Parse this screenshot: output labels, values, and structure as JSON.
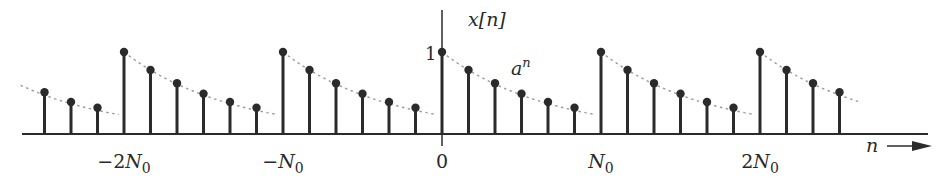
{
  "figure": {
    "y_label": "x[n]",
    "x_label": "n",
    "envelope_label": "a",
    "envelope_exponent": "n",
    "y_tick_label": "1",
    "x_tick_labels": [
      {
        "text": "−2N",
        "sub": "0",
        "n": -12
      },
      {
        "text": "−N",
        "sub": "0",
        "n": -6
      },
      {
        "text": "0",
        "sub": "",
        "n": 0
      },
      {
        "text": "N",
        "sub": "0",
        "n": 6
      },
      {
        "text": "2N",
        "sub": "0",
        "n": 12
      }
    ],
    "colors": {
      "stem": "#2b2b2b",
      "envelope": "#9a9a9a",
      "axis": "#2b2b2b"
    }
  },
  "chart_data": {
    "type": "stem",
    "title": "",
    "xlabel": "n",
    "ylabel": "x[n]",
    "period_samples": 6,
    "n": [
      -15,
      -14,
      -13,
      -12,
      -11,
      -10,
      -9,
      -8,
      -7,
      -6,
      -5,
      -4,
      -3,
      -2,
      -1,
      0,
      1,
      2,
      3,
      4,
      5,
      6,
      7,
      8,
      9,
      10,
      11,
      12,
      13,
      14,
      15
    ],
    "values": [
      0.51,
      0.39,
      0.32,
      1.0,
      0.78,
      0.62,
      0.49,
      0.39,
      0.32,
      1.0,
      0.78,
      0.62,
      0.49,
      0.39,
      0.32,
      1.0,
      0.78,
      0.62,
      0.49,
      0.39,
      0.32,
      1.0,
      0.78,
      0.62,
      0.49,
      0.39,
      0.32,
      1.0,
      0.78,
      0.62,
      0.51
    ],
    "x_ticks": [
      "-2N0",
      "-N0",
      "0",
      "N0",
      "2N0"
    ],
    "y_ticks": [
      "1"
    ],
    "annotations": [
      "a^n"
    ],
    "grid": false
  }
}
